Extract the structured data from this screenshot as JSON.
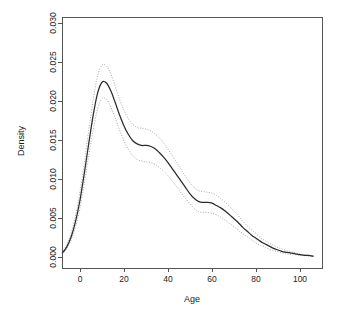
{
  "chart_data": {
    "type": "line",
    "title": "",
    "xlabel": "Age",
    "ylabel": "Density",
    "xlim": [
      -9,
      111
    ],
    "ylim": [
      0.0,
      0.0305
    ],
    "grid": false,
    "legend": null,
    "x_ticks": [
      0,
      20,
      40,
      60,
      80,
      100
    ],
    "x_tick_labels": [
      "0",
      "20",
      "40",
      "60",
      "80",
      "100"
    ],
    "y_ticks": [
      0.0,
      0.005,
      0.01,
      0.015,
      0.02,
      0.025,
      0.03
    ],
    "y_tick_labels": [
      "0.000",
      "0.005",
      "0.010",
      "0.015",
      "0.020",
      "0.025",
      "0.030"
    ],
    "colors": {
      "estimate": "#2b2b2b",
      "confidence_band": "#a8a8a8",
      "axis": "#555555",
      "background": "#ffffff"
    },
    "series": [
      {
        "name": "Density estimate",
        "style": "solid",
        "x": [
          -8,
          -6,
          -4,
          -2,
          0,
          2,
          4,
          6,
          8,
          10,
          12,
          14,
          16,
          18,
          20,
          22,
          24,
          26,
          28,
          30,
          32,
          34,
          36,
          38,
          40,
          42,
          44,
          46,
          48,
          50,
          52,
          54,
          56,
          58,
          60,
          62,
          64,
          66,
          68,
          70,
          72,
          74,
          76,
          78,
          80,
          82,
          84,
          86,
          88,
          90,
          92,
          94,
          96,
          98,
          100,
          102,
          104,
          106
        ],
        "values": [
          0.0005,
          0.0013,
          0.0026,
          0.0046,
          0.0073,
          0.0108,
          0.0146,
          0.0182,
          0.021,
          0.0224,
          0.0223,
          0.0213,
          0.0198,
          0.0182,
          0.0168,
          0.0157,
          0.0149,
          0.0145,
          0.0143,
          0.0143,
          0.0142,
          0.0139,
          0.0134,
          0.0128,
          0.0121,
          0.0113,
          0.0105,
          0.0097,
          0.0089,
          0.0081,
          0.0075,
          0.0071,
          0.007,
          0.007,
          0.0069,
          0.0066,
          0.0063,
          0.0059,
          0.0054,
          0.0049,
          0.0044,
          0.0038,
          0.0033,
          0.0028,
          0.0024,
          0.002,
          0.0017,
          0.0014,
          0.0011,
          0.0009,
          0.0007,
          0.0006,
          0.0005,
          0.0004,
          0.0003,
          0.0002,
          0.0002,
          0.0001
        ]
      },
      {
        "name": "Upper confidence band",
        "style": "dotted",
        "x": [
          -8,
          -6,
          -4,
          -2,
          0,
          2,
          4,
          6,
          8,
          10,
          12,
          14,
          16,
          18,
          20,
          22,
          24,
          26,
          28,
          30,
          32,
          34,
          36,
          38,
          40,
          42,
          44,
          46,
          48,
          50,
          52,
          54,
          56,
          58,
          60,
          62,
          64,
          66,
          68,
          70,
          72,
          74,
          76,
          78,
          80,
          82,
          84,
          86,
          88,
          90,
          92,
          94,
          96,
          98,
          100,
          102,
          104,
          106
        ],
        "values": [
          0.0006,
          0.0016,
          0.0031,
          0.0054,
          0.0084,
          0.0122,
          0.0163,
          0.0202,
          0.0232,
          0.0246,
          0.0245,
          0.0235,
          0.0219,
          0.0202,
          0.0188,
          0.0177,
          0.017,
          0.0166,
          0.0165,
          0.0164,
          0.0162,
          0.0158,
          0.0153,
          0.0146,
          0.0138,
          0.013,
          0.0121,
          0.0112,
          0.0103,
          0.0095,
          0.0089,
          0.0085,
          0.0084,
          0.0083,
          0.0082,
          0.0079,
          0.0075,
          0.007,
          0.0065,
          0.0059,
          0.0053,
          0.0046,
          0.004,
          0.0035,
          0.003,
          0.0025,
          0.0021,
          0.0018,
          0.0015,
          0.0012,
          0.001,
          0.0008,
          0.0007,
          0.0005,
          0.0004,
          0.0003,
          0.0002,
          0.0001
        ]
      },
      {
        "name": "Lower confidence band",
        "style": "dotted",
        "x": [
          -8,
          -6,
          -4,
          -2,
          0,
          2,
          4,
          6,
          8,
          10,
          12,
          14,
          16,
          18,
          20,
          22,
          24,
          26,
          28,
          30,
          32,
          34,
          36,
          38,
          40,
          42,
          44,
          46,
          48,
          50,
          52,
          54,
          56,
          58,
          60,
          62,
          64,
          66,
          68,
          70,
          72,
          74,
          76,
          78,
          80,
          82,
          84,
          86,
          88,
          90,
          92,
          94,
          96,
          98,
          100,
          102,
          104,
          106
        ],
        "values": [
          0.0004,
          0.0011,
          0.0022,
          0.0039,
          0.0063,
          0.0095,
          0.013,
          0.0163,
          0.019,
          0.0203,
          0.0202,
          0.0192,
          0.0178,
          0.0163,
          0.0149,
          0.0138,
          0.013,
          0.0125,
          0.0123,
          0.0122,
          0.0121,
          0.0119,
          0.0115,
          0.011,
          0.0104,
          0.0097,
          0.009,
          0.0082,
          0.0075,
          0.0068,
          0.0062,
          0.0058,
          0.0057,
          0.0057,
          0.0056,
          0.0054,
          0.0051,
          0.0047,
          0.0043,
          0.0039,
          0.0034,
          0.003,
          0.0026,
          0.0022,
          0.0018,
          0.0015,
          0.0013,
          0.001,
          0.0008,
          0.0007,
          0.0005,
          0.0004,
          0.0003,
          0.0003,
          0.0002,
          0.0002,
          0.0001,
          0.0001
        ]
      }
    ]
  }
}
